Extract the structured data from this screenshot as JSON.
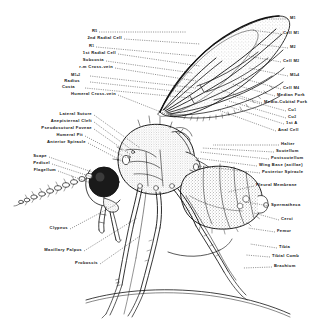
{
  "figure": {
    "style": "black-and-white stipple line engraving",
    "background_color": "#ffffff",
    "ink_color": "#111111"
  },
  "labels_left": [
    {
      "id": "r5",
      "text": "R",
      "sub": "5",
      "x": 97,
      "y": 31
    },
    {
      "id": "second-radial-cell",
      "text": "2nd Radial Cell",
      "sub": "",
      "x": 122,
      "y": 38
    },
    {
      "id": "r1",
      "text": "R",
      "sub": "1",
      "x": 94,
      "y": 46
    },
    {
      "id": "first-radial-cell",
      "text": "1st Radial Cell",
      "sub": "",
      "x": 116,
      "y": 53
    },
    {
      "id": "subcosta",
      "text": "Subcosta",
      "sub": "",
      "x": 104,
      "y": 60
    },
    {
      "id": "r-m-cross-vein",
      "text": "r-m  Cross-vein",
      "sub": "",
      "x": 113,
      "y": 67
    },
    {
      "id": "media",
      "text": "M",
      "sub": "1+2",
      "x": 80,
      "y": 75
    },
    {
      "id": "radius",
      "text": "Radius",
      "sub": "",
      "x": 80,
      "y": 81
    },
    {
      "id": "costa",
      "text": "Costa",
      "sub": "",
      "x": 75,
      "y": 87
    },
    {
      "id": "humeral-cross-vein",
      "text": "Humeral  Cross-vein",
      "sub": "",
      "x": 116,
      "y": 94
    },
    {
      "id": "lateral-suture",
      "text": "Lateral  Suture",
      "sub": "",
      "x": 92,
      "y": 114
    },
    {
      "id": "anepisternal-cleft",
      "text": "Anepisternal  Cleft",
      "sub": "",
      "x": 92,
      "y": 121
    },
    {
      "id": "pseudosutural-foveae",
      "text": "Pseudosutural  Foveae",
      "sub": "",
      "x": 92,
      "y": 128
    },
    {
      "id": "humeral-pit",
      "text": "Humeral  Pit",
      "sub": "",
      "x": 83,
      "y": 135
    },
    {
      "id": "anterior-spiracle",
      "text": "Anterior  Spiracle",
      "sub": "",
      "x": 86,
      "y": 142
    },
    {
      "id": "scape",
      "text": "Scape",
      "sub": "",
      "x": 47,
      "y": 156
    },
    {
      "id": "pedicel",
      "text": "Pedicel",
      "sub": "",
      "x": 50,
      "y": 163
    },
    {
      "id": "flagellum",
      "text": "Flagellum",
      "sub": "",
      "x": 56,
      "y": 170
    },
    {
      "id": "clypeus",
      "text": "Clypeus",
      "sub": "",
      "x": 68,
      "y": 228
    },
    {
      "id": "maxillary-palpus",
      "text": "Maxillary  Palpus",
      "sub": "",
      "x": 82,
      "y": 250
    },
    {
      "id": "proboscis",
      "text": "Proboscis",
      "sub": "",
      "x": 98,
      "y": 263
    }
  ],
  "labels_right": [
    {
      "id": "m1",
      "text": "M",
      "sub": "1",
      "x": 290,
      "y": 18
    },
    {
      "id": "cell-m1",
      "text": "Cell  M",
      "sub": "1",
      "x": 283,
      "y": 33
    },
    {
      "id": "m2",
      "text": "M",
      "sub": "2",
      "x": 290,
      "y": 47
    },
    {
      "id": "cell-m2",
      "text": "Cell  M",
      "sub": "2",
      "x": 283,
      "y": 61
    },
    {
      "id": "m3-4",
      "text": "M",
      "sub": "3+4",
      "x": 290,
      "y": 75
    },
    {
      "id": "cell-m4",
      "text": "Cell  M",
      "sub": "4",
      "x": 283,
      "y": 88
    },
    {
      "id": "median-fork",
      "text": "Median  Fork",
      "sub": "",
      "x": 277,
      "y": 95
    },
    {
      "id": "medio-cubital-fork",
      "text": "Medio-Cubital  Fork",
      "sub": "",
      "x": 264,
      "y": 102
    },
    {
      "id": "cu1",
      "text": "Cu",
      "sub": "1",
      "x": 288,
      "y": 110
    },
    {
      "id": "cu2",
      "text": "Cu",
      "sub": "2",
      "x": 288,
      "y": 117
    },
    {
      "id": "first-a",
      "text": "1st  A",
      "sub": "",
      "x": 286,
      "y": 123
    },
    {
      "id": "anal-cell",
      "text": "Anal  Cell",
      "sub": "",
      "x": 278,
      "y": 130
    },
    {
      "id": "halter",
      "text": "Halter",
      "sub": "",
      "x": 281,
      "y": 144
    },
    {
      "id": "scutellum",
      "text": "Scutellum",
      "sub": "",
      "x": 276,
      "y": 151
    },
    {
      "id": "postscutellum",
      "text": "Postscutellum",
      "sub": "",
      "x": 271,
      "y": 158
    },
    {
      "id": "wing-base",
      "text": "Wing  Base   (axillae)",
      "sub": "",
      "x": 259,
      "y": 165
    },
    {
      "id": "posterior-spiracle",
      "text": "Posterior  Spiracle",
      "sub": "",
      "x": 262,
      "y": 172
    },
    {
      "id": "pleural-membrane",
      "text": "Pleural  Membrane",
      "sub": "",
      "x": 256,
      "y": 185
    },
    {
      "id": "spermatheca",
      "text": "Spermatheca",
      "sub": "",
      "x": 271,
      "y": 205
    },
    {
      "id": "cerci",
      "text": "Cerci",
      "sub": "",
      "x": 281,
      "y": 219
    },
    {
      "id": "femur",
      "text": "Femur",
      "sub": "",
      "x": 277,
      "y": 231
    },
    {
      "id": "tibia",
      "text": "Tibia",
      "sub": "",
      "x": 279,
      "y": 247
    },
    {
      "id": "tibial-comb",
      "text": "Tibial  Comb",
      "sub": "",
      "x": 272,
      "y": 256
    },
    {
      "id": "brachium",
      "text": "Brachium",
      "sub": "",
      "x": 274,
      "y": 266
    }
  ],
  "leaders_left": [
    {
      "id": "leader-r5",
      "x1": 99,
      "y1": 32,
      "x2": 186,
      "y2": 32
    },
    {
      "id": "leader-2rc",
      "x1": 124,
      "y1": 39,
      "x2": 200,
      "y2": 44
    },
    {
      "id": "leader-r1",
      "x1": 96,
      "y1": 47,
      "x2": 196,
      "y2": 56
    },
    {
      "id": "leader-1rc",
      "x1": 118,
      "y1": 54,
      "x2": 200,
      "y2": 66
    },
    {
      "id": "leader-sc",
      "x1": 106,
      "y1": 61,
      "x2": 193,
      "y2": 73
    },
    {
      "id": "leader-rm",
      "x1": 115,
      "y1": 68,
      "x2": 196,
      "y2": 81
    },
    {
      "id": "leader-m",
      "x1": 90,
      "y1": 76,
      "x2": 196,
      "y2": 88
    },
    {
      "id": "leader-rad",
      "x1": 90,
      "y1": 82,
      "x2": 193,
      "y2": 93
    },
    {
      "id": "leader-cos",
      "x1": 85,
      "y1": 88,
      "x2": 190,
      "y2": 98
    },
    {
      "id": "leader-hcv",
      "x1": 118,
      "y1": 95,
      "x2": 176,
      "y2": 118
    },
    {
      "id": "leader-ls",
      "x1": 94,
      "y1": 115,
      "x2": 140,
      "y2": 148
    },
    {
      "id": "leader-ac",
      "x1": 94,
      "y1": 122,
      "x2": 136,
      "y2": 153
    },
    {
      "id": "leader-pf",
      "x1": 94,
      "y1": 129,
      "x2": 131,
      "y2": 155
    },
    {
      "id": "leader-hp",
      "x1": 85,
      "y1": 136,
      "x2": 127,
      "y2": 158
    },
    {
      "id": "leader-as",
      "x1": 88,
      "y1": 143,
      "x2": 124,
      "y2": 162
    },
    {
      "id": "leader-sca",
      "x1": 49,
      "y1": 157,
      "x2": 92,
      "y2": 172
    },
    {
      "id": "leader-ped",
      "x1": 52,
      "y1": 164,
      "x2": 92,
      "y2": 177
    },
    {
      "id": "leader-fla",
      "x1": 58,
      "y1": 171,
      "x2": 88,
      "y2": 182
    },
    {
      "id": "leader-cly",
      "x1": 70,
      "y1": 229,
      "x2": 115,
      "y2": 205
    },
    {
      "id": "leader-mp",
      "x1": 84,
      "y1": 251,
      "x2": 137,
      "y2": 218
    },
    {
      "id": "leader-pro",
      "x1": 100,
      "y1": 264,
      "x2": 140,
      "y2": 236
    }
  ],
  "leaders_right": [
    {
      "id": "leader-m1",
      "x1": 288,
      "y1": 19,
      "x2": 262,
      "y2": 19
    },
    {
      "id": "leader-cm1",
      "x1": 281,
      "y1": 34,
      "x2": 252,
      "y2": 30
    },
    {
      "id": "leader-m2",
      "x1": 288,
      "y1": 48,
      "x2": 256,
      "y2": 44
    },
    {
      "id": "leader-cm2",
      "x1": 281,
      "y1": 62,
      "x2": 248,
      "y2": 56
    },
    {
      "id": "leader-m34",
      "x1": 288,
      "y1": 76,
      "x2": 249,
      "y2": 68
    },
    {
      "id": "leader-cm4",
      "x1": 281,
      "y1": 89,
      "x2": 241,
      "y2": 78
    },
    {
      "id": "leader-mf",
      "x1": 275,
      "y1": 96,
      "x2": 232,
      "y2": 84
    },
    {
      "id": "leader-mcf",
      "x1": 262,
      "y1": 103,
      "x2": 221,
      "y2": 90
    },
    {
      "id": "leader-cu1",
      "x1": 286,
      "y1": 111,
      "x2": 232,
      "y2": 96
    },
    {
      "id": "leader-cu2",
      "x1": 286,
      "y1": 118,
      "x2": 229,
      "y2": 101
    },
    {
      "id": "leader-1a",
      "x1": 284,
      "y1": 124,
      "x2": 224,
      "y2": 105
    },
    {
      "id": "leader-anc",
      "x1": 276,
      "y1": 131,
      "x2": 218,
      "y2": 110
    },
    {
      "id": "leader-hal",
      "x1": 279,
      "y1": 145,
      "x2": 213,
      "y2": 145
    },
    {
      "id": "leader-scu",
      "x1": 274,
      "y1": 152,
      "x2": 202,
      "y2": 148
    },
    {
      "id": "leader-psc",
      "x1": 269,
      "y1": 159,
      "x2": 200,
      "y2": 152
    },
    {
      "id": "leader-wb",
      "x1": 257,
      "y1": 166,
      "x2": 196,
      "y2": 158
    },
    {
      "id": "leader-ps",
      "x1": 260,
      "y1": 173,
      "x2": 198,
      "y2": 166
    },
    {
      "id": "leader-plm",
      "x1": 254,
      "y1": 186,
      "x2": 228,
      "y2": 192
    },
    {
      "id": "leader-spm",
      "x1": 269,
      "y1": 206,
      "x2": 246,
      "y2": 202
    },
    {
      "id": "leader-cer",
      "x1": 279,
      "y1": 220,
      "x2": 254,
      "y2": 213
    },
    {
      "id": "leader-fem",
      "x1": 275,
      "y1": 232,
      "x2": 248,
      "y2": 228
    },
    {
      "id": "leader-tib",
      "x1": 277,
      "y1": 248,
      "x2": 250,
      "y2": 244
    },
    {
      "id": "leader-tcm",
      "x1": 270,
      "y1": 257,
      "x2": 246,
      "y2": 255
    },
    {
      "id": "leader-bra",
      "x1": 272,
      "y1": 267,
      "x2": 243,
      "y2": 268
    }
  ]
}
